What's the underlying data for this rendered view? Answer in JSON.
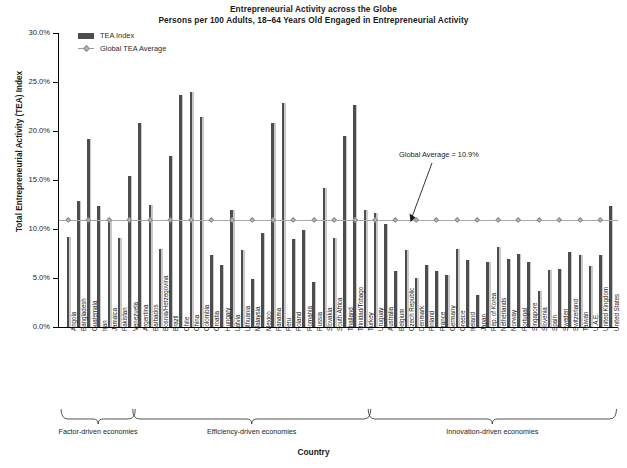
{
  "title": {
    "line1": "Entrepreneurial Activity across the Globe",
    "line2": "Persons per 100 Adults, 18–64 Years Old Engaged in Entrepreneurial Activity"
  },
  "legend": {
    "items": [
      {
        "label": "TEA Index",
        "type": "bar",
        "color": "#4d4d4d"
      },
      {
        "label": "Global TEA Average",
        "type": "line",
        "color": "#b5b5b5"
      }
    ]
  },
  "annotation": {
    "text": "Global Average = 10.9%"
  },
  "axes": {
    "ylabel": "Total Entrepreneurial Activity (TEA) Index",
    "xlabel": "Country",
    "yticks": [
      "0.0%",
      "5.0%",
      "10.0%",
      "15.0%",
      "20.0%",
      "25.0%",
      "30.0%"
    ]
  },
  "groups": [
    {
      "name": "Factor-driven economies",
      "start": 0,
      "end": 6
    },
    {
      "name": "Efficiency-driven economies",
      "start": 7,
      "end": 29
    },
    {
      "name": "Innovation-driven economies",
      "start": 30,
      "end": 53
    }
  ],
  "chart_data": {
    "type": "bar",
    "title": "Entrepreneurial Activity across the Globe",
    "subtitle": "Persons per 100 Adults, 18–64 Years Old Engaged in Entrepreneurial Activity",
    "xlabel": "Country",
    "ylabel": "Total Entrepreneurial Activity (TEA) Index",
    "ylim": [
      0,
      30
    ],
    "yticks": [
      0,
      5,
      10,
      15,
      20,
      25,
      30
    ],
    "grid": false,
    "legend_position": "top-left",
    "reference_line": {
      "name": "Global TEA Average",
      "value": 10.9
    },
    "categories": [
      "Angola",
      "Bangladesh",
      "Guatemala",
      "Iran",
      "Jamaica",
      "Pakistan",
      "Venezuela",
      "Argentina",
      "Barbados",
      "Bosnia/Herzegovina",
      "Brazil",
      "Chile",
      "China",
      "Colombia",
      "Croatia",
      "Hungary",
      "Latvia",
      "Lithuania",
      "Malaysia",
      "Mexico",
      "Panama",
      "Peru",
      "Poland",
      "Romania",
      "Russia",
      "Slovakia",
      "South Africa",
      "Thailand",
      "Trinidad/Tobago",
      "Turkey",
      "Uruguay",
      "Australia",
      "Belgium",
      "Czech Republic",
      "Denmark",
      "Finland",
      "France",
      "Germany",
      "Greece",
      "Ireland",
      "Japan",
      "Rep. of Korea",
      "Netherlands",
      "Norway",
      "Portugal",
      "Singapore",
      "Slovenia",
      "Spain",
      "Sweden",
      "Switzerland",
      "Taiwan",
      "U.A.E.",
      "United Kingdom",
      "United States"
    ],
    "values": [
      9.2,
      12.9,
      19.2,
      12.3,
      11.0,
      9.1,
      15.4,
      20.8,
      12.5,
      8.0,
      17.5,
      23.7,
      24.0,
      21.4,
      7.3,
      6.3,
      11.9,
      7.9,
      4.9,
      9.6,
      20.8,
      22.9,
      9.0,
      9.9,
      4.6,
      14.2,
      9.1,
      19.5,
      22.7,
      11.9,
      11.6,
      10.5,
      5.7,
      7.9,
      5.0,
      6.3,
      5.7,
      5.3,
      8.0,
      6.8,
      3.3,
      6.6,
      8.2,
      6.9,
      7.5,
      6.6,
      3.7,
      5.8,
      5.9,
      7.7,
      7.3,
      6.2,
      7.3,
      12.3
    ],
    "series": [
      {
        "name": "TEA Index",
        "color": "#4d4d4d"
      }
    ]
  }
}
